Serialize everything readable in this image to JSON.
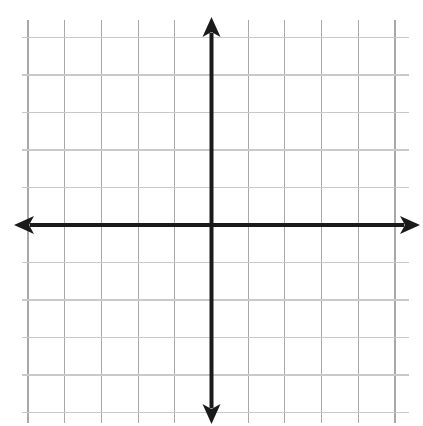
{
  "figure": {
    "name": "blank-cartesian-coordinate-plane",
    "background_color": "#ffffff",
    "width": 423,
    "height": 426
  },
  "chart_data": {
    "type": "scatter",
    "title": "",
    "subtitle": "",
    "xlabel": "",
    "ylabel": "",
    "series": [
      {
        "name": "plotted-points",
        "x": [],
        "y": []
      }
    ],
    "annotations": [],
    "legend": {
      "visible": false,
      "position": "none",
      "entries": []
    },
    "grid": {
      "visible": true,
      "color": "#b0b0b0",
      "horizontal_color": "#c9c9c9",
      "vertical_color": "#a8a8a8",
      "line_width": 1,
      "x_count": 11,
      "y_count": 11,
      "x_spacing_px": 36.7,
      "y_spacing_px": 37.5,
      "x_positions_px": [
        28,
        64.7,
        101.4,
        138.1,
        174.8,
        211.5,
        248.2,
        284.9,
        321.6,
        358.3,
        395
      ],
      "y_positions_px": [
        37.5,
        75,
        112.5,
        150,
        187.5,
        225,
        262.5,
        300,
        337.5,
        375,
        412.5
      ],
      "x_extent_px": [
        22,
        409
      ],
      "y_extent_px": [
        20,
        423
      ]
    },
    "axes": {
      "origin_px": [
        211.5,
        225
      ],
      "xlim": [
        -5,
        5
      ],
      "ylim": [
        -5,
        5
      ],
      "x_tick_labels": [],
      "y_tick_labels": [],
      "color": "#1a1a1a",
      "line_width": 4,
      "x_axis": {
        "name": "x-axis",
        "y_px": 225,
        "start_px": 14,
        "end_px": 420,
        "arrow_left": true,
        "arrow_right": true
      },
      "y_axis": {
        "name": "y-axis",
        "x_px": 211.5,
        "start_px": 17,
        "end_px": 424,
        "arrow_up": true,
        "arrow_down": true
      },
      "arrowhead": {
        "length_px": 20,
        "half_width_px": 9,
        "notch_px": 5
      }
    }
  }
}
